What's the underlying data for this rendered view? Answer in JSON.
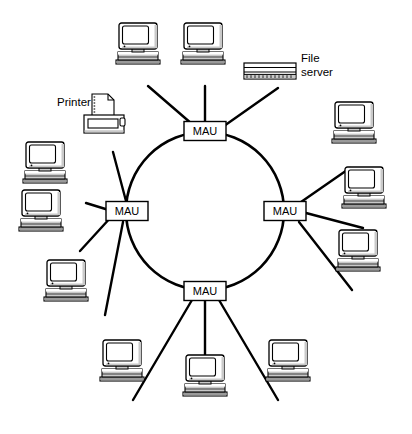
{
  "diagram": {
    "type": "token-ring-network-topology",
    "ring": {
      "cx": 205,
      "cy": 211,
      "r": 79
    },
    "labels": {
      "printer": "Printer",
      "file_server_line1": "File",
      "file_server_line2": "server"
    },
    "colors": {
      "background": "#ffffff",
      "stroke": "#000000",
      "device_fill": "#ffffff",
      "device_shade": "#c9c9c9",
      "device_shade_dark": "#9a9a9a",
      "screen_fill": "#ffffff"
    },
    "mau_nodes": [
      {
        "id": "mau-top",
        "label": "MAU",
        "x": 205,
        "y": 131,
        "w": 42,
        "h": 19
      },
      {
        "id": "mau-left",
        "label": "MAU",
        "x": 127,
        "y": 211,
        "w": 42,
        "h": 19
      },
      {
        "id": "mau-right",
        "label": "MAU",
        "x": 285,
        "y": 211,
        "w": 42,
        "h": 19
      },
      {
        "id": "mau-bottom",
        "label": "MAU",
        "x": 205,
        "y": 291,
        "w": 42,
        "h": 19
      }
    ],
    "computers": [
      {
        "id": "pc-top-1",
        "x": 138,
        "y": 48,
        "scale": 1.0,
        "attached_to": "mau-top"
      },
      {
        "id": "pc-top-2",
        "x": 203,
        "y": 48,
        "scale": 1.0,
        "attached_to": "mau-top"
      },
      {
        "id": "pc-left-1",
        "x": 45,
        "y": 167,
        "scale": 1.0,
        "attached_to": "mau-left"
      },
      {
        "id": "pc-left-2",
        "x": 41,
        "y": 215,
        "scale": 1.0,
        "attached_to": "mau-left"
      },
      {
        "id": "pc-left-3",
        "x": 66,
        "y": 285,
        "scale": 1.0,
        "attached_to": "mau-left"
      },
      {
        "id": "pc-right-1",
        "x": 354,
        "y": 127,
        "scale": 1.0,
        "attached_to": "mau-right"
      },
      {
        "id": "pc-right-2",
        "x": 364,
        "y": 192,
        "scale": 1.0,
        "attached_to": "mau-right"
      },
      {
        "id": "pc-right-3",
        "x": 358,
        "y": 255,
        "scale": 1.0,
        "attached_to": "mau-right"
      },
      {
        "id": "pc-bottom-1",
        "x": 122,
        "y": 365,
        "scale": 1.0,
        "attached_to": "mau-bottom"
      },
      {
        "id": "pc-bottom-2",
        "x": 205,
        "y": 380,
        "scale": 1.0,
        "attached_to": "mau-bottom"
      },
      {
        "id": "pc-bottom-3",
        "x": 288,
        "y": 365,
        "scale": 1.0,
        "attached_to": "mau-bottom"
      }
    ],
    "peripherals": [
      {
        "id": "printer",
        "kind": "printer",
        "x": 104,
        "y": 113,
        "label": "Printer",
        "label_x": 57,
        "label_y": 101,
        "attached_to": "mau-left"
      },
      {
        "id": "file-server",
        "kind": "file-server",
        "x": 270,
        "y": 71,
        "label": "File server",
        "label_x": 300,
        "label_y": 62,
        "attached_to": "mau-top"
      }
    ],
    "connections": [
      {
        "from": "pc-top-1",
        "to": "mau-top"
      },
      {
        "from": "pc-top-2",
        "to": "mau-top"
      },
      {
        "from": "file-server",
        "to": "mau-top"
      },
      {
        "from": "pc-left-1",
        "to": "mau-left"
      },
      {
        "from": "pc-left-2",
        "to": "mau-left"
      },
      {
        "from": "pc-left-3",
        "to": "mau-left"
      },
      {
        "from": "printer",
        "to": "mau-left"
      },
      {
        "from": "pc-right-1",
        "to": "mau-right"
      },
      {
        "from": "pc-right-2",
        "to": "mau-right"
      },
      {
        "from": "pc-right-3",
        "to": "mau-right"
      },
      {
        "from": "pc-bottom-1",
        "to": "mau-bottom"
      },
      {
        "from": "pc-bottom-2",
        "to": "mau-bottom"
      },
      {
        "from": "pc-bottom-3",
        "to": "mau-bottom"
      }
    ]
  }
}
